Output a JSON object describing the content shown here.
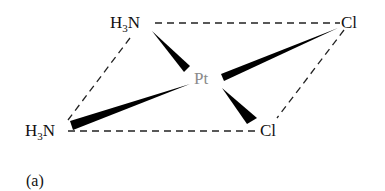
{
  "diagram": {
    "caption": "(a)",
    "molecule": "cisplatin",
    "atoms": {
      "top_left": {
        "prefix": "H",
        "sub": "3",
        "suffix": "N"
      },
      "top_right": {
        "label": "Cl"
      },
      "center": {
        "label": "Pt"
      },
      "bottom_left": {
        "prefix": "H",
        "sub": "3",
        "suffix": "N"
      },
      "bottom_right": {
        "label": "Cl"
      }
    },
    "colors": {
      "line": "#000000",
      "center_atom": "#8a8a8a",
      "background": "#ffffff"
    }
  }
}
